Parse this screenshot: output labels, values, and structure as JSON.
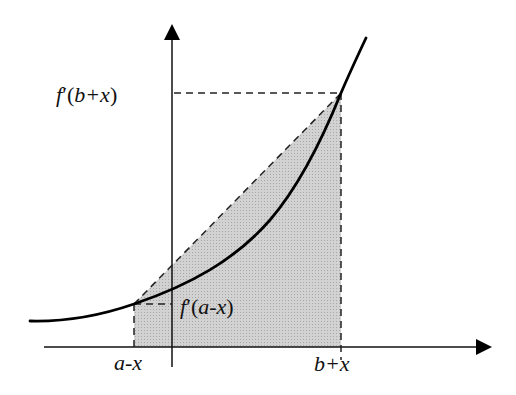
{
  "diagram": {
    "title": "",
    "labels": {
      "y_upper": {
        "fn": "f",
        "prime": "′",
        "open": "(",
        "arg": "b+x",
        "close": ")"
      },
      "y_lower": {
        "fn": "f",
        "prime": "′",
        "open": "(",
        "arg": "a-x",
        "close": ")"
      },
      "x_left": "a-x",
      "x_right": "b+x"
    },
    "colors": {
      "axis": "#111111",
      "curve": "#000000",
      "shade": "#c8c8c8",
      "dash": "#222222",
      "background": "#ffffff"
    },
    "elements": [
      "vertical axis with arrow",
      "horizontal axis with arrow",
      "convex curve f'",
      "shaded trapezoid from a-x to b+x under secant line",
      "dashed guides to axis labels"
    ]
  }
}
